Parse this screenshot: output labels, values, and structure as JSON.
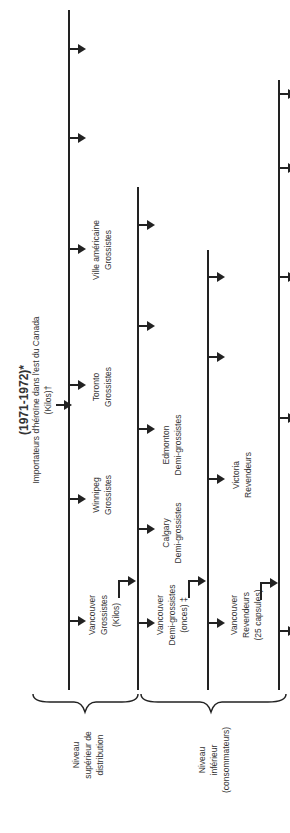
{
  "title": "(1971-1972)*",
  "importers": {
    "line1": "Importateurs d'héroïne dans l'est du Canada",
    "line2": "(Kilos)†"
  },
  "levels": {
    "upper": [
      "Niveau",
      "supérieur de",
      "distribution"
    ],
    "lower": [
      "Niveau",
      "inférieur",
      "(consommateurs)"
    ]
  },
  "nodes": {
    "vancouver_grossistes": [
      "Vancouver",
      "Grossistes",
      "(Kilos)"
    ],
    "winnipeg": [
      "Winnipeg",
      "Grossistes"
    ],
    "toronto": [
      "Toronto",
      "Grossistes"
    ],
    "ville_americaine": [
      "Ville américaine",
      "Grossistes"
    ],
    "vancouver_demi": [
      "Vancouver",
      "Demi-grossistes",
      "(onces) ‡"
    ],
    "calgary": [
      "Calgary",
      "Demi-grossistes"
    ],
    "edmonton": [
      "Edmonton",
      "Demi-grossistes"
    ],
    "vancouver_revendeurs": [
      "Vancouver",
      "Revendeurs",
      "(25 capsules)"
    ],
    "victoria": [
      "Victoria",
      "Revendeurs"
    ]
  },
  "colors": {
    "ink": "#222222",
    "text": "#333333",
    "background": "#ffffff"
  }
}
